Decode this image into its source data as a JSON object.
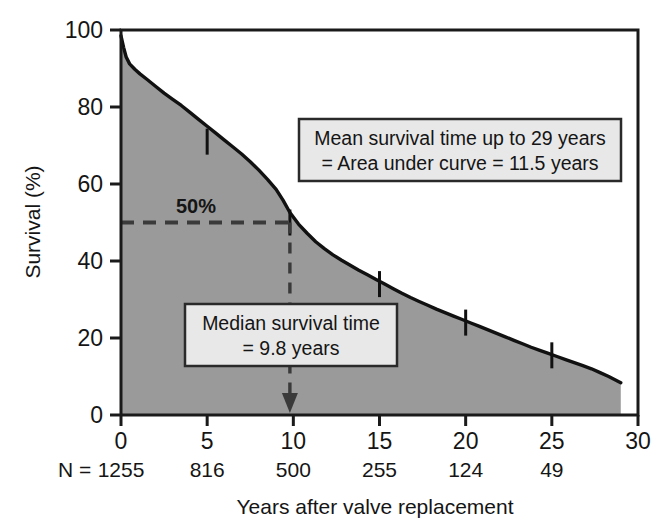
{
  "chart_data": {
    "type": "line",
    "title": "",
    "subtitle": "",
    "xlabel": "Years after valve replacement",
    "ylabel": "Survival (%)",
    "xlim": [
      0,
      30
    ],
    "ylim": [
      0,
      100
    ],
    "xticks": [
      0,
      5,
      10,
      15,
      20,
      25,
      30
    ],
    "xticklabels": [
      "0",
      "5",
      "10",
      "15",
      "20",
      "25",
      "30"
    ],
    "yticks": [
      0,
      20,
      40,
      60,
      80,
      100
    ],
    "yticklabels": [
      "0",
      "20",
      "40",
      "60",
      "80",
      "100"
    ],
    "grid": false,
    "legend": "none",
    "fill": "area-under-curve",
    "fill_color": "#9a9a9a",
    "line_color": "#111111",
    "series": [
      {
        "name": "Survival",
        "x": [
          0,
          0.15,
          0.3,
          0.5,
          0.8,
          1.1,
          1.5,
          2.0,
          2.5,
          3.0,
          3.5,
          4.0,
          4.5,
          5.0,
          5.5,
          6.0,
          6.5,
          7.0,
          7.5,
          8.0,
          8.5,
          9.0,
          9.4,
          9.8,
          10.3,
          10.8,
          11.3,
          11.8,
          12.3,
          12.8,
          13.3,
          13.8,
          14.3,
          14.8,
          15.3,
          15.8,
          16.3,
          16.8,
          17.3,
          17.8,
          18.3,
          18.8,
          19.3,
          19.8,
          20.3,
          20.8,
          21.3,
          21.8,
          22.3,
          22.8,
          23.3,
          23.8,
          24.3,
          24.8,
          25.3,
          25.8,
          26.3,
          26.8,
          27.3,
          27.8,
          28.3,
          29.0
        ],
        "y": [
          98.5,
          95.5,
          93.0,
          91.2,
          89.8,
          88.6,
          87.2,
          85.4,
          83.6,
          82.0,
          80.4,
          78.6,
          76.8,
          75.0,
          73.2,
          71.4,
          69.6,
          67.8,
          65.8,
          63.6,
          61.2,
          58.6,
          55.8,
          52.6,
          49.6,
          47.2,
          45.0,
          43.2,
          41.6,
          40.2,
          38.9,
          37.6,
          36.4,
          35.2,
          34.0,
          32.8,
          31.6,
          30.5,
          29.5,
          28.5,
          27.5,
          26.6,
          25.7,
          24.8,
          23.9,
          23.0,
          22.1,
          21.2,
          20.3,
          19.4,
          18.5,
          17.6,
          16.8,
          16.0,
          15.2,
          14.4,
          13.6,
          12.8,
          12.0,
          11.0,
          10.0,
          8.4
        ]
      }
    ],
    "censor_marks": [
      {
        "x": 5.0,
        "y": 71.0
      },
      {
        "x": 9.8,
        "y": 50.0
      },
      {
        "x": 15.0,
        "y": 34.0
      },
      {
        "x": 20.0,
        "y": 24.0
      },
      {
        "x": 25.0,
        "y": 15.5
      }
    ],
    "reference_lines": [
      {
        "name": "median-horizontal",
        "orientation": "horizontal",
        "y": 50,
        "x_from": 0,
        "x_to": 9.8,
        "style": "dashed",
        "label": "50%"
      },
      {
        "name": "median-vertical",
        "orientation": "vertical",
        "x": 9.8,
        "y_from": 50,
        "y_to": 0,
        "style": "dashed",
        "arrow": true
      }
    ],
    "annotations": [
      {
        "name": "mean-survival-box",
        "lines": [
          "Mean survival time up to 29 years",
          "= Area under curve = 11.5 years"
        ],
        "x": 17.5,
        "y": 70
      },
      {
        "name": "median-survival-box",
        "lines": [
          "Median survival time",
          "= 9.8 years"
        ],
        "x": 12.5,
        "y": 22
      }
    ],
    "risk_table": {
      "row_label": "N =",
      "times": [
        0,
        5,
        10,
        15,
        20,
        25
      ],
      "counts": [
        "1255",
        "816",
        "500",
        "255",
        "124",
        "49"
      ]
    }
  },
  "labels": {
    "percent_marker": "50%",
    "y_axis_title": "Survival (%)",
    "x_axis_title": "Years after valve replacement",
    "n_row_label": "N ="
  },
  "colors": {
    "area_fill": "#9a9a9a",
    "curve": "#111111",
    "box_background": "#e8e8e8",
    "box_border": "#2a2a2a",
    "axis": "#1a1a1a",
    "dashed_line": "#3a3a3a",
    "page_background": "#ffffff"
  }
}
